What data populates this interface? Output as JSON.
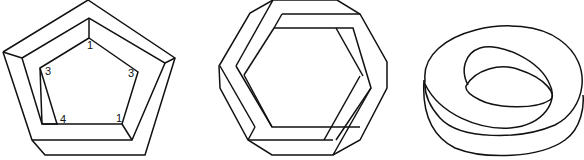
{
  "figures": [
    {
      "name": "impossible-pentagon",
      "labels": [
        {
          "text": "1",
          "x": 87,
          "y": 49
        },
        {
          "text": "3",
          "x": 45,
          "y": 75
        },
        {
          "text": "3",
          "x": 128,
          "y": 77
        },
        {
          "text": "4",
          "x": 60,
          "y": 123
        },
        {
          "text": "1",
          "x": 116,
          "y": 122
        }
      ]
    },
    {
      "name": "impossible-hexagon-ring"
    },
    {
      "name": "mobius-torus"
    }
  ],
  "colors": {
    "stroke": "#111111",
    "background": "#ffffff"
  }
}
